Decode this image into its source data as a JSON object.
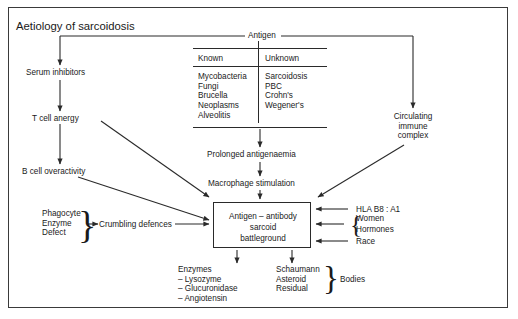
{
  "diagram": {
    "title": "Aetiology of sarcoidosis",
    "antigen_label": "Antigen",
    "table": {
      "columns": [
        "Known",
        "Unknown"
      ],
      "known_items": [
        "Mycobacteria",
        "Fungi",
        "Brucella",
        "Neoplasms",
        "Alveolitis"
      ],
      "unknown_items": [
        "Sarcoidosis",
        "PBC",
        "Crohn's",
        "Wegener's"
      ],
      "known_text": "Mycobacteria\nFungi\nBrucella\nNeoplasms\nAlveolitis",
      "unknown_text": "Sarcoidosis\nPBC\nCrohn's\nWegener's"
    },
    "nodes": {
      "serum_inhibitors": "Serum inhibitors",
      "t_cell_anergy": "T cell anergy",
      "b_cell_overactivity": "B cell overactivity",
      "phagocyte_enzyme_defect": "Phagocyte\nEnzyme\nDefect",
      "crumbling_defences": "Crumbling defences",
      "prolonged_antigenaemia": "Prolonged antigenaemia",
      "macrophage_stimulation": "Macrophage stimulation",
      "battleground": "Antigen – antibody\nsarcoid\nbattleground",
      "circulating_immune_complex": "Circulating\nimmune\ncomplex",
      "hla": "HLA B8 : A1",
      "women": "Women",
      "hormones": "Hormones",
      "race": "Race",
      "enzymes": "Enzymes\n– Lysozyme\n– Glucuronidase\n– Angiotensin",
      "bodies_list": "Schaumann\nAsteroid\nResidual",
      "bodies_label": "Bodies"
    },
    "colors": {
      "frame": "#3a3a3a",
      "line": "#2a2a2a",
      "text": "#1a1a1a",
      "background": "#ffffff"
    }
  }
}
